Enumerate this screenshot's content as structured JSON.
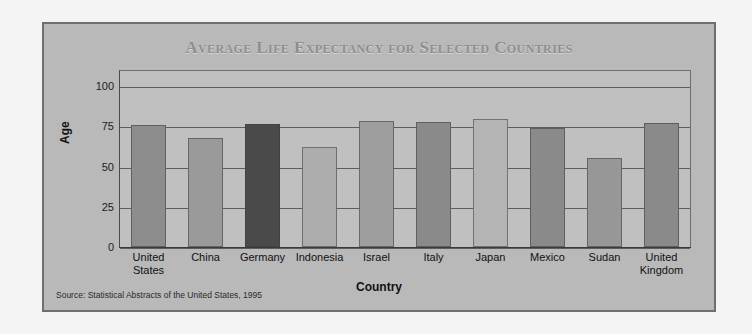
{
  "page": {
    "background_color": "#f4f4f4"
  },
  "chart_frame": {
    "background_color": "#b9b9b9",
    "border_color": "#6f6f6f"
  },
  "source_note": "Source: Statistical Abstracts of the United States, 1995",
  "chart_data": {
    "type": "bar",
    "title": "Average Life Expectancy for Selected Countries",
    "xlabel": "Country",
    "ylabel": "Age",
    "ylim": [
      0,
      110
    ],
    "yticks": [
      0,
      25,
      50,
      75,
      100
    ],
    "ytick_labels": [
      "0",
      "25",
      "50",
      "75",
      "100"
    ],
    "grid": true,
    "legend": "none",
    "categories": [
      "United States",
      "China",
      "Germany",
      "Indonesia",
      "Israel",
      "Italy",
      "Japan",
      "Mexico",
      "Sudan",
      "United Kingdom"
    ],
    "category_lines": [
      [
        "United",
        "States"
      ],
      [
        "China",
        ""
      ],
      [
        "Germany",
        ""
      ],
      [
        "Indonesia",
        ""
      ],
      [
        "Israel",
        ""
      ],
      [
        "Italy",
        ""
      ],
      [
        "Japan",
        ""
      ],
      [
        "Mexico",
        ""
      ],
      [
        "Sudan",
        ""
      ],
      [
        "United",
        "Kingdom"
      ]
    ],
    "values": [
      76,
      68,
      76.5,
      62,
      78.5,
      78,
      79.5,
      74,
      55.5,
      77
    ],
    "bar_colors": [
      "#8d8d8d",
      "#9a9a9a",
      "#4a4a4a",
      "#adadad",
      "#9e9e9e",
      "#8a8a8a",
      "#b4b4b4",
      "#8a8a8a",
      "#979797",
      "#8a8a8a"
    ]
  }
}
